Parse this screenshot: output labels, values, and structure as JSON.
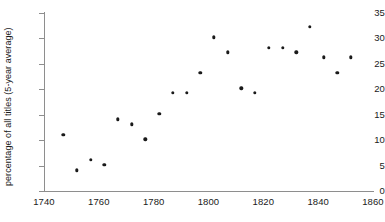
{
  "chart_data": {
    "type": "scatter",
    "title": "",
    "subtitle": "",
    "xlabel": "",
    "ylabel": "percentage of all titles (5-year average)",
    "xlim": [
      1740,
      1860
    ],
    "ylim": [
      0,
      35
    ],
    "xticks": [
      1740,
      1760,
      1780,
      1800,
      1820,
      1840,
      1860
    ],
    "yticks": [
      0,
      5,
      10,
      15,
      20,
      25,
      30,
      35
    ],
    "xtick_labels": [
      "1740",
      "1760",
      "1780",
      "1800",
      "1820",
      "1840",
      "1860"
    ],
    "ytick_labels": [
      "0",
      "5",
      "10",
      "15",
      "20",
      "25",
      "30",
      "35"
    ],
    "grid": false,
    "legend": false,
    "legend_position": "none",
    "marker": "circle",
    "marker_color": "#1a1a1a",
    "marker_size": 3.4,
    "x": [
      1747,
      1752,
      1757,
      1762,
      1767,
      1772,
      1777,
      1782,
      1787,
      1792,
      1797,
      1802,
      1807,
      1812,
      1817,
      1822,
      1827,
      1832,
      1837,
      1842,
      1847,
      1852
    ],
    "y": [
      11.1,
      4.1,
      6.1,
      5.1,
      14.1,
      13.1,
      10.2,
      15.2,
      19.3,
      19.3,
      23.2,
      30.2,
      27.3,
      20.2,
      19.3,
      28.2,
      28.2,
      27.3,
      32.3,
      26.3,
      23.3,
      26.3
    ],
    "points": [
      {
        "x": 1747,
        "y": 11.1
      },
      {
        "x": 1752,
        "y": 4.1
      },
      {
        "x": 1757,
        "y": 6.1
      },
      {
        "x": 1762,
        "y": 5.1
      },
      {
        "x": 1767,
        "y": 14.1
      },
      {
        "x": 1772,
        "y": 13.1
      },
      {
        "x": 1777,
        "y": 10.2
      },
      {
        "x": 1782,
        "y": 15.2
      },
      {
        "x": 1787,
        "y": 19.3
      },
      {
        "x": 1792,
        "y": 19.3
      },
      {
        "x": 1797,
        "y": 23.2
      },
      {
        "x": 1802,
        "y": 30.2
      },
      {
        "x": 1807,
        "y": 27.3
      },
      {
        "x": 1812,
        "y": 20.2
      },
      {
        "x": 1817,
        "y": 19.3
      },
      {
        "x": 1822,
        "y": 28.2
      },
      {
        "x": 1827,
        "y": 28.2
      },
      {
        "x": 1832,
        "y": 27.3
      },
      {
        "x": 1837,
        "y": 32.3
      },
      {
        "x": 1842,
        "y": 26.3
      },
      {
        "x": 1847,
        "y": 23.3
      },
      {
        "x": 1852,
        "y": 26.3
      }
    ],
    "colors": {
      "marker": "#1a1a1a",
      "axis": "#8e8e8e",
      "text": "#1a1a1a",
      "background": "#ffffff"
    }
  }
}
